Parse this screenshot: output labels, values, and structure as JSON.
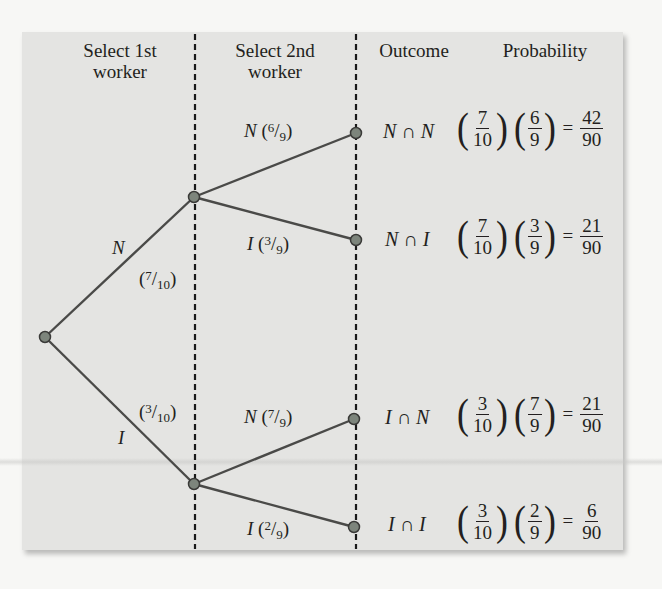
{
  "headers": {
    "col1": [
      "Select 1st",
      "worker"
    ],
    "col2": [
      "Select 2nd",
      "worker"
    ],
    "col3": "Outcome",
    "col4": "Probability"
  },
  "first_level": {
    "N": {
      "event": "N",
      "prob_num": "7",
      "prob_den": "10"
    },
    "I": {
      "event": "I",
      "prob_num": "3",
      "prob_den": "10"
    }
  },
  "second_level": [
    {
      "event": "N",
      "prob_num": "6",
      "prob_den": "9"
    },
    {
      "event": "I",
      "prob_num": "3",
      "prob_den": "9"
    },
    {
      "event": "N",
      "prob_num": "7",
      "prob_den": "9"
    },
    {
      "event": "I",
      "prob_num": "2",
      "prob_den": "9"
    }
  ],
  "outcomes": [
    {
      "label": "N ∩ N",
      "p1_num": "7",
      "p1_den": "10",
      "p2_num": "6",
      "p2_den": "9",
      "r_num": "42",
      "r_den": "90"
    },
    {
      "label": "N ∩ I",
      "p1_num": "7",
      "p1_den": "10",
      "p2_num": "3",
      "p2_den": "9",
      "r_num": "21",
      "r_den": "90"
    },
    {
      "label": "I ∩ N",
      "p1_num": "3",
      "p1_den": "10",
      "p2_num": "7",
      "p2_den": "9",
      "r_num": "21",
      "r_den": "90"
    },
    {
      "label": "I ∩ I",
      "p1_num": "3",
      "p1_den": "10",
      "p2_num": "2",
      "p2_den": "9",
      "r_num": "6",
      "r_den": "90"
    }
  ],
  "symbols": {
    "open": "(",
    "close": ")",
    "slash": "/",
    "equals": "="
  },
  "colors": {
    "panel": "#e4e4e2",
    "line": "#4a4a48",
    "node": "#7d857c",
    "dash": "#1a1a1a"
  }
}
